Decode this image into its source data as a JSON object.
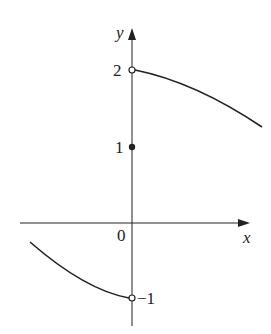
{
  "graph": {
    "axes": {
      "x_label": "x",
      "y_label": "y",
      "origin_label": "0"
    },
    "ticks": {
      "y2": "2",
      "y1": "1",
      "ym1": "−1"
    },
    "points": [
      {
        "x": 0,
        "y": 2,
        "type": "open"
      },
      {
        "x": 0,
        "y": 1,
        "type": "filled"
      },
      {
        "x": 0,
        "y": -1,
        "type": "open"
      }
    ],
    "pieces": [
      {
        "domain": "x > 0",
        "description": "decreasing curve starting at open (0,2)"
      },
      {
        "domain": "x < 0",
        "description": "decreasing curve ending at open (0,-1)"
      }
    ],
    "color": "#222222"
  }
}
